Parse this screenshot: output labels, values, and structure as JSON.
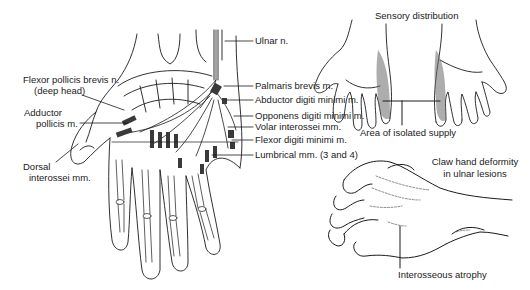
{
  "figure": {
    "left_panel": {
      "title": "Ulnar nerve distribution in the palm",
      "labels_right": {
        "ulnar_n": "Ulnar n.",
        "palmaris_brevis": "Palmaris brevis m.",
        "abductor_digiti_minimi": "Abductor digiti minimi m.",
        "opponens_digiti_minimi": "Opponens digiti minimi m.",
        "volar_interossei": "Volar interossei mm.",
        "flexor_digiti_minimi": "Flexor digiti minimi m.",
        "lumbrical": "Lumbrical mm. (3 and 4)"
      },
      "labels_left": {
        "flexor_pollicis_brevis_line1": "Flexor pollicis brevis n.",
        "flexor_pollicis_brevis_line2": "(deep head)",
        "adductor_pollicis_line1": "Adductor",
        "adductor_pollicis_line2": "pollicis m.",
        "dorsal_interossei_line1": "Dorsal",
        "dorsal_interossei_line2": "interossei mm."
      }
    },
    "top_right_panel": {
      "title": "Sensory distribution",
      "annotation": "Area of isolated supply"
    },
    "bottom_right_panel": {
      "title_line1": "Claw hand deformity",
      "title_line2": "in ulnar lesions",
      "annotation": "Interosseous atrophy"
    },
    "colors": {
      "ink": "#1a1a1a",
      "background": "#ffffff",
      "shading": "#555555"
    }
  }
}
